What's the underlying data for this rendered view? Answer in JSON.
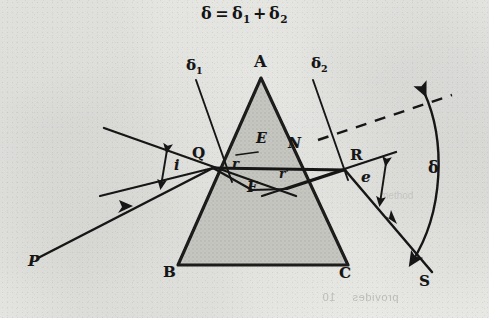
{
  "figure": {
    "equation_html": "&delta; = &delta;<sub>1</sub> + &delta;<sub>2</sub>",
    "equation_text": "δ = δ1 + δ2",
    "ink_color": "#151515",
    "paper_color": "#efefec",
    "prism_fill": "#c9c9c4"
  },
  "labels": {
    "apex": "A",
    "base_left": "B",
    "base_right": "C",
    "entry_point": "Q",
    "exit_point": "R",
    "normal_entry": "E",
    "normal_exit": "N",
    "foot": "F",
    "source": "P",
    "screen": "S",
    "angle_incidence": "i",
    "angle_emergence": "e",
    "angle_refraction": "r",
    "angle_refraction_prime": "r'",
    "deviation": "δ",
    "deviation_1": "δ",
    "deviation_1_sub": "1",
    "deviation_2": "δ",
    "deviation_2_sub": "2"
  },
  "geometry": {
    "apex": [
      261,
      78
    ],
    "base_left": [
      178,
      265
    ],
    "base_right": [
      348,
      265
    ],
    "entry_point": [
      213,
      168
    ],
    "exit_point": [
      345,
      170
    ],
    "incident_start": [
      38,
      258
    ],
    "emergent_end": [
      432,
      272
    ]
  },
  "bleed_through": {
    "line_bottom": "provides",
    "line_bottom_2": "10",
    "right_faint": "method"
  }
}
